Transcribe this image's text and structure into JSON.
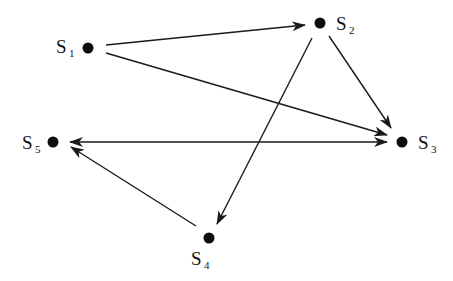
{
  "diagram": {
    "type": "directed-graph",
    "nodes": [
      {
        "id": "S1",
        "base": "S",
        "sub": "1",
        "x": 88,
        "y": 48,
        "label_x": 56,
        "label_y": 53,
        "sub_x": 69,
        "sub_y": 57
      },
      {
        "id": "S2",
        "base": "S",
        "sub": "2",
        "x": 320,
        "y": 23,
        "label_x": 336,
        "label_y": 30,
        "sub_x": 349,
        "sub_y": 34
      },
      {
        "id": "S3",
        "base": "S",
        "sub": "3",
        "x": 402,
        "y": 142,
        "label_x": 418,
        "label_y": 149,
        "sub_x": 431,
        "sub_y": 153
      },
      {
        "id": "S4",
        "base": "S",
        "sub": "4",
        "x": 209,
        "y": 238,
        "label_x": 191,
        "label_y": 265,
        "sub_x": 204,
        "sub_y": 269
      },
      {
        "id": "S5",
        "base": "S",
        "sub": "5",
        "x": 53,
        "y": 142,
        "label_x": 22,
        "label_y": 149,
        "sub_x": 35,
        "sub_y": 153
      }
    ],
    "edges": [
      {
        "from": "S1",
        "to": "S2",
        "x1": 106,
        "y1": 45,
        "x2": 305,
        "y2": 25,
        "direction": "forward"
      },
      {
        "from": "S1",
        "to": "S3",
        "x1": 106,
        "y1": 53,
        "x2": 387,
        "y2": 135,
        "direction": "forward"
      },
      {
        "from": "S2",
        "to": "S3",
        "x1": 329,
        "y1": 36,
        "x2": 391,
        "y2": 128,
        "direction": "forward"
      },
      {
        "from": "S2",
        "to": "S4",
        "x1": 312,
        "y1": 38,
        "x2": 217,
        "y2": 224,
        "direction": "forward"
      },
      {
        "from": "S4",
        "to": "S5",
        "x1": 196,
        "y1": 226,
        "x2": 71,
        "y2": 147,
        "direction": "forward"
      },
      {
        "from": "S5",
        "to": "S3",
        "x1": 70,
        "y1": 142,
        "x2": 387,
        "y2": 142,
        "direction": "both"
      }
    ]
  }
}
